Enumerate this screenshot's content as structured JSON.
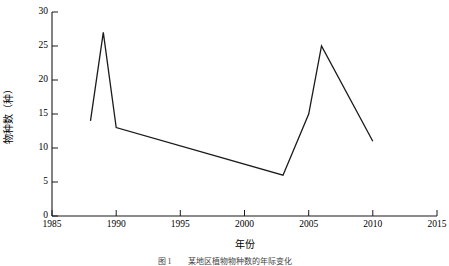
{
  "chart_data": {
    "type": "line",
    "title": "",
    "xlabel": "年份",
    "ylabel": "物种数（种）",
    "xlim": [
      1985,
      2015
    ],
    "ylim": [
      0,
      30
    ],
    "xticks": [
      1985,
      1990,
      1995,
      2000,
      2005,
      2010,
      2015
    ],
    "xtick_labels": [
      "1985",
      "1990",
      "1995",
      "2000",
      "2005",
      "2010",
      "2015"
    ],
    "yticks": [
      0,
      5,
      10,
      15,
      20,
      25,
      30
    ],
    "ytick_labels": [
      "0",
      "5",
      "10",
      "15",
      "20",
      "25",
      "30"
    ],
    "grid": false,
    "legend": false,
    "line_color": "#1a1a1a",
    "series": [
      {
        "name": "物种数",
        "x": [
          1988,
          1989,
          1990,
          2003,
          2005,
          2006,
          2010
        ],
        "values": [
          14,
          27,
          13,
          6,
          15,
          25,
          11
        ]
      }
    ]
  },
  "figure": {
    "caption": "图 1　　某地区植物物种数的年际变化",
    "axis_title_x": "年份",
    "axis_title_y": "物种数（种）"
  }
}
